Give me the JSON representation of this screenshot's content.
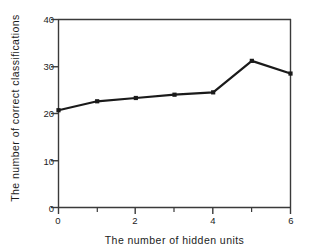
{
  "chart_data": {
    "type": "line",
    "title": "",
    "xlabel": "The number of hidden units",
    "ylabel": "The number of correct classifications",
    "x": [
      0,
      1,
      2,
      3,
      4,
      5,
      6
    ],
    "values": [
      20.7,
      22.6,
      23.3,
      24.0,
      24.5,
      31.2,
      28.5
    ],
    "series": [
      {
        "name": "correct classifications",
        "values": [
          20.7,
          22.6,
          23.3,
          24.0,
          24.5,
          31.2,
          28.5
        ]
      }
    ],
    "xlim": [
      0,
      6
    ],
    "ylim": [
      0,
      40
    ],
    "xticks": [
      0,
      2,
      4,
      6
    ],
    "xtick_labels": [
      "0",
      "2",
      "4",
      "6"
    ],
    "xminor_ticks": [
      1,
      3,
      5
    ],
    "yticks": [
      0,
      10,
      20,
      30,
      40
    ],
    "ytick_labels": [
      "0",
      "10",
      "20",
      "30",
      "40"
    ],
    "grid": false,
    "legend": null,
    "legend_position": "none",
    "marker": "square",
    "line_color": "#1a1a1a",
    "marker_color": "#1a1a1a",
    "background_color": "#ffffff",
    "axis_color": "#3a3a3a",
    "annotations": []
  }
}
